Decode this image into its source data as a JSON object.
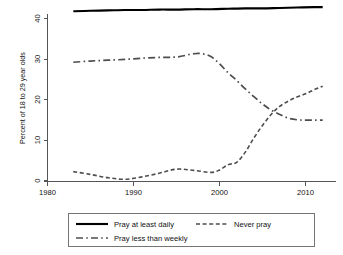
{
  "chart_data": {
    "type": "line",
    "title": "",
    "subtitle": "",
    "xlabel": "",
    "ylabel": "Percent of 18 to 29 year olds",
    "xlim": [
      1980,
      2014
    ],
    "ylim": [
      0,
      44
    ],
    "xticks": [
      1980,
      1990,
      2000,
      2010
    ],
    "xtick_labels": [
      "1980",
      "1990",
      "2000",
      "2010"
    ],
    "yticks": [
      0,
      10,
      20,
      30,
      40
    ],
    "ytick_labels": [
      "0",
      "10",
      "20",
      "30",
      "40"
    ],
    "grid": false,
    "legend_position": "below",
    "series": [
      {
        "name": "Pray at least daily",
        "style": "solid",
        "color": "#000000",
        "x": [
          1983,
          1985,
          1987,
          1989,
          1991,
          1993,
          1995,
          1997,
          1999,
          2001,
          2003,
          2005,
          2007,
          2009,
          2011,
          2012
        ],
        "values": [
          41.8,
          41.9,
          42.0,
          42.1,
          42.1,
          42.2,
          42.2,
          42.3,
          42.3,
          42.4,
          42.5,
          42.5,
          42.6,
          42.7,
          42.8,
          42.8
        ]
      },
      {
        "name": "Pray less than weekly",
        "style": "long-dash-dot",
        "color": "#4d4d4d",
        "x": [
          1983,
          1985,
          1987,
          1989,
          1991,
          1993,
          1995,
          1997,
          1998,
          1999,
          2000,
          2001,
          2002,
          2003,
          2004,
          2005,
          2006,
          2007,
          2008,
          2009,
          2010,
          2011,
          2012
        ],
        "values": [
          29.2,
          29.5,
          29.7,
          29.9,
          30.2,
          30.4,
          30.5,
          31.3,
          31.3,
          30.6,
          28.8,
          26.6,
          24.7,
          22.6,
          20.7,
          18.9,
          17.4,
          16.3,
          15.4,
          15.0,
          14.9,
          14.9,
          14.9
        ]
      },
      {
        "name": "Never pray",
        "style": "short-dash",
        "color": "#4d4d4d",
        "x": [
          1983,
          1985,
          1987,
          1989,
          1991,
          1993,
          1995,
          1997,
          1999,
          2000,
          2001,
          2002,
          2003,
          2004,
          2005,
          2006,
          2007,
          2008,
          2009,
          2010,
          2011,
          2012
        ],
        "values": [
          2.2,
          1.5,
          0.7,
          0.3,
          0.9,
          1.8,
          2.8,
          2.5,
          2.0,
          2.6,
          3.9,
          4.5,
          7.0,
          10.5,
          13.6,
          16.3,
          18.3,
          19.6,
          20.6,
          21.4,
          22.4,
          23.3
        ]
      }
    ]
  },
  "legend": {
    "entries": [
      {
        "label": "Pray at least daily",
        "style": "solid"
      },
      {
        "label": "Never pray",
        "style": "short-dash"
      },
      {
        "label": "Pray less than weekly",
        "style": "long-dash-dot"
      }
    ]
  }
}
